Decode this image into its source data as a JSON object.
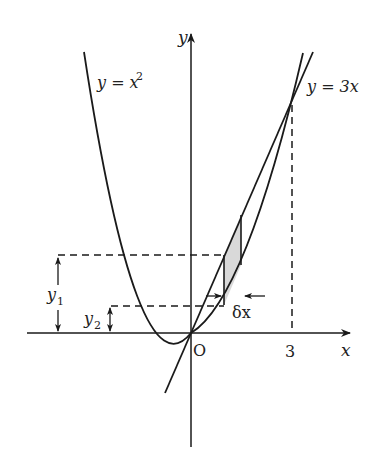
{
  "diagram": {
    "labels": {
      "y_axis": "y",
      "x_axis": "x",
      "origin": "O",
      "x_tick": "3",
      "curve": "y = x",
      "curve_exp": "2",
      "line": "y = 3x",
      "y1": "y",
      "y1_sub": "1",
      "y2": "y",
      "y2_sub": "2",
      "delta": "δx"
    },
    "colors": {
      "stroke": "#1a1a1a",
      "shade": "#d9d9d9",
      "background": "#ffffff"
    }
  }
}
